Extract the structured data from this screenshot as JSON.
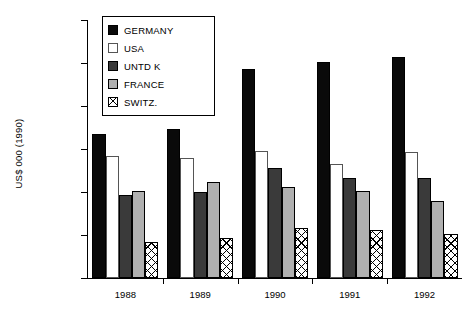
{
  "chart_data": {
    "type": "bar",
    "title": "",
    "xlabel": "",
    "ylabel": "US$ 000 (1990)",
    "categories": [
      "1988",
      "1989",
      "1990",
      "1991",
      "1992"
    ],
    "ylim": [
      0,
      600000
    ],
    "yticks": [
      0,
      100000,
      200000,
      300000,
      400000,
      500000,
      600000
    ],
    "ytick_labels": [
      "0",
      "100 000",
      "200 000",
      "300 000",
      "400 000",
      "500 000",
      "600 000"
    ],
    "grid": false,
    "legend_position": "top-left",
    "series": [
      {
        "name": "GERMANY",
        "swatch": "solid-black",
        "color": "#0a0a0a",
        "values": [
          335000,
          347000,
          485000,
          503000,
          515000
        ]
      },
      {
        "name": "USA",
        "swatch": "solid-white",
        "color": "#ffffff",
        "values": [
          283000,
          280000,
          296000,
          265000,
          292000
        ]
      },
      {
        "name": "UNTD K",
        "swatch": "solid-dark-gray",
        "color": "#3a3a3a",
        "values": [
          192000,
          199000,
          256000,
          232000,
          232000
        ]
      },
      {
        "name": "FRANCE",
        "swatch": "solid-light-gray",
        "color": "#b0b0b0",
        "values": [
          203000,
          224000,
          211000,
          203000,
          178000
        ]
      },
      {
        "name": "SWITZ.",
        "swatch": "crosshatch",
        "color": "#ffffff",
        "values": [
          84000,
          92000,
          116000,
          111000,
          103000
        ]
      }
    ]
  }
}
